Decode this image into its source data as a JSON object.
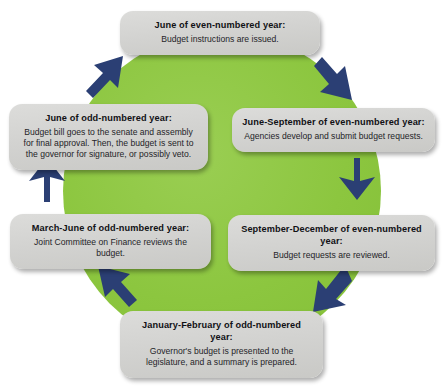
{
  "diagram": {
    "type": "cycle",
    "title": "",
    "center_color": "#8cc63f",
    "box_color": "#d3d3d1",
    "arrow_color": "#2b3f74",
    "flow_direction": "clockwise",
    "steps": [
      {
        "id": "june-even",
        "position": "top",
        "title": "June of even-numbered year:",
        "body": "Budget instructions are issued."
      },
      {
        "id": "june-september-even",
        "position": "right-upper",
        "title": "June-September of even-numbered year:",
        "body": "Agencies develop and submit budget requests."
      },
      {
        "id": "september-december-even",
        "position": "right-lower",
        "title": "September-December of even-numbered year:",
        "body": "Budget requests are reviewed."
      },
      {
        "id": "january-february-odd",
        "position": "bottom",
        "title": "January-February of odd-numbered year:",
        "body": "Governor's budget is presented to the legislature, and a summary is prepared."
      },
      {
        "id": "march-june-odd",
        "position": "left-lower",
        "title": "March-June of odd-numbered year:",
        "body": "Joint Committee on Finance reviews the budget."
      },
      {
        "id": "june-odd",
        "position": "left-upper",
        "title": "June of odd-numbered year:",
        "body": "Budget bill goes to the senate and assembly for final approval. Then, the budget is sent to the governor for signature, or possibly veto."
      }
    ],
    "arrows": [
      {
        "id": "arrow-top-to-right",
        "from": "june-even",
        "to": "june-september-even",
        "direction": "down-right"
      },
      {
        "id": "arrow-right-vertical",
        "from": "june-september-even",
        "to": "september-december-even",
        "direction": "down"
      },
      {
        "id": "arrow-right-to-bottom",
        "from": "september-december-even",
        "to": "january-february-odd",
        "direction": "down-left"
      },
      {
        "id": "arrow-bottom-to-left",
        "from": "january-february-odd",
        "to": "march-june-odd",
        "direction": "up-left"
      },
      {
        "id": "arrow-left-vertical",
        "from": "march-june-odd",
        "to": "june-odd",
        "direction": "up"
      },
      {
        "id": "arrow-left-to-top",
        "from": "june-odd",
        "to": "june-even",
        "direction": "up-right"
      }
    ]
  }
}
